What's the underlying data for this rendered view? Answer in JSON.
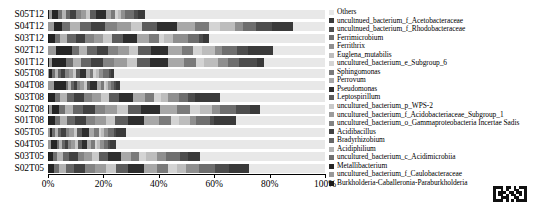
{
  "chart_data": {
    "type": "bar",
    "orientation": "horizontal",
    "stacked": true,
    "normalized": true,
    "title": "",
    "xlabel": "",
    "ylabel": "",
    "xlim": [
      0,
      100
    ],
    "xticks": [
      "0%",
      "20%",
      "40%",
      "60%",
      "80%",
      "100%"
    ],
    "xtick_values": [
      0,
      20,
      40,
      60,
      80,
      100
    ],
    "grid": false,
    "legend_position": "right",
    "categories": [
      "S05T12",
      "S04T12",
      "S03T12",
      "S02T12",
      "S01T12",
      "S05T08",
      "S04T08",
      "S03T08",
      "S02T08",
      "S01T08",
      "S05T05",
      "S04T05",
      "S03T05",
      "S02T05"
    ],
    "series": [
      {
        "name": "Others",
        "color": "#e8e8e8",
        "values": [
          65.0,
          11.5,
          42.0,
          18.5,
          22.0,
          77.0,
          74.0,
          39.5,
          24.5,
          33.0,
          71.0,
          75.5,
          46.5,
          27.5
        ]
      },
      {
        "name": "uncultured_bacterium_f_Acetobacteraceae",
        "color": "#3a3a3a",
        "values": [
          2.5,
          7.5,
          2.0,
          9.0,
          2.5,
          1.0,
          1.5,
          9.5,
          3.5,
          8.0,
          3.5,
          2.0,
          4.5,
          7.0
        ]
      },
      {
        "name": "uncultured_bacterium_f_Rhodobacteraceae",
        "color": "#4d4d4d",
        "values": [
          1.5,
          6.0,
          1.5,
          4.0,
          6.5,
          0.8,
          0.6,
          2.5,
          5.5,
          1.5,
          1.0,
          0.8,
          3.0,
          5.0
        ]
      },
      {
        "name": "Ferrimicrobium",
        "color": "#6e6e6e",
        "values": [
          3.0,
          4.5,
          4.0,
          5.5,
          4.0,
          2.0,
          1.2,
          3.5,
          6.0,
          5.0,
          2.0,
          1.5,
          5.0,
          6.0
        ]
      },
      {
        "name": "Ferrithrix",
        "color": "#8f8f8f",
        "values": [
          1.5,
          3.0,
          5.5,
          2.5,
          3.5,
          1.5,
          1.0,
          4.0,
          3.0,
          2.5,
          1.5,
          1.5,
          3.5,
          4.5
        ]
      },
      {
        "name": "Euglena_mutabilis",
        "color": "#bdbdbd",
        "values": [
          1.0,
          5.5,
          3.0,
          4.5,
          5.0,
          1.2,
          0.8,
          3.0,
          4.5,
          4.0,
          1.0,
          1.0,
          4.0,
          3.5
        ]
      },
      {
        "name": "uncultured_bacterium_e_Subgroup_6",
        "color": "#d4d4d4",
        "values": [
          1.2,
          4.0,
          2.0,
          3.5,
          3.0,
          1.0,
          0.7,
          2.5,
          3.5,
          3.0,
          0.9,
          0.8,
          2.5,
          3.0
        ]
      },
      {
        "name": "Sphingomonas",
        "color": "#7a7a7a",
        "values": [
          1.5,
          5.0,
          3.5,
          4.0,
          4.5,
          1.3,
          1.0,
          3.5,
          5.0,
          4.5,
          1.5,
          1.2,
          3.0,
          4.0
        ]
      },
      {
        "name": "Perrovum",
        "color": "#a8a8a8",
        "values": [
          2.0,
          6.5,
          4.5,
          5.0,
          5.5,
          1.5,
          1.5,
          4.5,
          6.5,
          5.5,
          1.8,
          1.5,
          4.0,
          5.0
        ]
      },
      {
        "name": "Pseudomonas",
        "color": "#2e2e2e",
        "values": [
          3.5,
          7.0,
          5.0,
          6.0,
          6.5,
          2.0,
          2.5,
          5.0,
          7.0,
          6.0,
          2.5,
          2.0,
          4.5,
          5.5
        ]
      },
      {
        "name": "Leptospirillum",
        "color": "#5c5c5c",
        "values": [
          2.0,
          5.5,
          4.0,
          4.5,
          5.0,
          1.5,
          1.2,
          4.0,
          5.0,
          4.5,
          1.8,
          1.5,
          3.5,
          4.5
        ]
      },
      {
        "name": "uncultured_bacterium_p_WPS-2",
        "color": "#c9c9c9",
        "values": [
          1.5,
          4.0,
          3.0,
          3.5,
          3.5,
          1.2,
          1.0,
          3.0,
          4.0,
          3.5,
          1.3,
          1.0,
          2.5,
          3.5
        ]
      },
      {
        "name": "uncultured_bacterium_f_Acidobacteriaceae_Subgroup_1",
        "color": "#9c9c9c",
        "values": [
          2.0,
          5.0,
          3.5,
          4.0,
          4.5,
          1.5,
          1.3,
          3.5,
          4.5,
          4.0,
          1.5,
          1.3,
          3.0,
          4.0
        ]
      },
      {
        "name": "uncultured_bacterium_o_Gammaproteobacteria Incertae Sadis",
        "color": "#838383",
        "values": [
          1.8,
          4.5,
          3.0,
          3.5,
          4.0,
          1.3,
          1.1,
          3.0,
          4.0,
          3.5,
          1.4,
          1.1,
          2.5,
          3.5
        ]
      },
      {
        "name": "Acidibacillus",
        "color": "#414141",
        "values": [
          2.0,
          5.0,
          3.5,
          4.0,
          4.5,
          1.5,
          1.3,
          3.5,
          4.5,
          4.0,
          1.5,
          1.3,
          3.0,
          4.0
        ]
      },
      {
        "name": "Bradyrhizobium",
        "color": "#666666",
        "values": [
          1.5,
          4.0,
          3.0,
          3.5,
          3.5,
          1.2,
          1.0,
          3.0,
          3.5,
          3.0,
          1.2,
          1.0,
          2.5,
          3.0
        ]
      },
      {
        "name": "Acidiphilium",
        "color": "#b3b3b3",
        "values": [
          1.5,
          3.5,
          2.5,
          3.0,
          3.0,
          1.1,
          0.9,
          2.5,
          3.0,
          2.5,
          1.1,
          0.9,
          2.0,
          2.5
        ]
      },
      {
        "name": "uncultured_bacterium_c_Acidimicrobiia",
        "color": "#707070",
        "values": [
          1.5,
          3.0,
          2.0,
          2.5,
          2.5,
          1.0,
          0.8,
          2.0,
          2.5,
          2.0,
          1.0,
          0.8,
          1.5,
          2.0
        ]
      },
      {
        "name": "Metallibacterium",
        "color": "#252525",
        "values": [
          2.0,
          3.0,
          2.0,
          5.5,
          5.0,
          0.9,
          4.6,
          2.0,
          2.5,
          2.0,
          0.9,
          2.3,
          1.5,
          2.0
        ]
      },
      {
        "name": "uncultured_bacterium_f_Caulobacteraceae",
        "color": "#999999",
        "values": [
          1.0,
          2.0,
          0.3,
          3.0,
          1.0,
          0.5,
          2.0,
          0.3,
          1.0,
          0.0,
          0.6,
          1.0,
          0.3,
          0.0
        ]
      },
      {
        "name": "Burkholderia-Caballeronia-Paraburkholderia",
        "color": "#1a1a1a",
        "values": [
          0.5,
          0.0,
          0.2,
          0.0,
          0.5,
          0.0,
          0.0,
          0.2,
          0.5,
          0.5,
          0.0,
          0.0,
          0.2,
          0.0
        ]
      }
    ]
  },
  "axis": {
    "x_tick_labels": [
      "0%",
      "20%",
      "40%",
      "60%",
      "80%",
      "100%"
    ]
  },
  "ylabels": [
    "S05T12",
    "S04T12",
    "S03T12",
    "S02T12",
    "S01T12",
    "S05T08",
    "S04T08",
    "S03T08",
    "S02T08",
    "S01T08",
    "S05T05",
    "S04T05",
    "S03T05",
    "S02T05"
  ],
  "legend": {
    "items": [
      "Others",
      "uncultnued_bacterium_f_Acetobacteraceae",
      "uncultnued_bacterium_f_Rhodobacteraceae",
      "Ferrimicrobium",
      "Ferrithrix",
      "Euglena_mutabilis",
      "uncultured_bacterium_e_Subgroup_6",
      "Sphingomonas",
      "Perrovum",
      "Pseudomonas",
      "Leptospirillum",
      "uncultured_bacterium_p_WPS-2",
      "uncultured_bacterium_f_Acidobacteriaceae_Subgroup_1",
      "uncultured_bacterium_o_Gammaproteobacteria Incertae Sadis",
      "Acidibacillus",
      "Bradyrhizobium",
      "Acidiphilium",
      "uncultured_bacterium_c_Acidimicrobiia",
      "Metallibacterium",
      "uncultured_bacterium_f_Caulobacteraceae",
      "Burkholderia-Caballeronia-Paraburkholderia"
    ]
  },
  "watermark": {
    "name": "qr-code"
  }
}
